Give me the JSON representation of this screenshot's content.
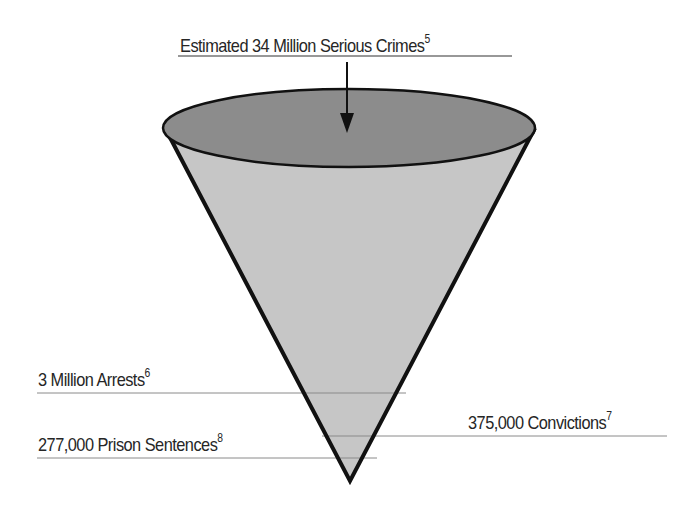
{
  "diagram": {
    "type": "funnel",
    "title": {
      "text": "Estimated 34 Million Serious Crimes",
      "footnote": "5"
    },
    "levels": [
      {
        "id": "arrests",
        "text": "3 Million Arrests",
        "footnote": "6",
        "side": "left"
      },
      {
        "id": "convictions",
        "text": "375,000 Convictions",
        "footnote": "7",
        "side": "right"
      },
      {
        "id": "prison",
        "text": "277,000 Prison Sentences",
        "footnote": "8",
        "side": "left"
      }
    ],
    "colors": {
      "cone_top": "#8c8c8c",
      "cone_body": "#c6c6c6",
      "outline": "#111111",
      "leader_line": "#8a8a8a",
      "text": "#262626"
    }
  }
}
